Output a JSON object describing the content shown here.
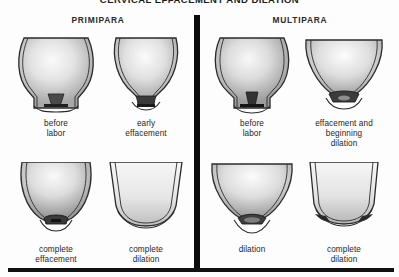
{
  "figure": {
    "title": "CERVICAL EFFACEMENT AND DILATION",
    "title_clipped": true
  },
  "columns": [
    {
      "key": "primipara",
      "label": "PRIMIPARA"
    },
    {
      "key": "multipara",
      "label": "MULTIPARA"
    }
  ],
  "divider": {
    "color": "#0a0a0a",
    "orientation": "vertical"
  },
  "bottom_rule": {
    "color": "#111111"
  },
  "colors": {
    "ink": "#1a1a1a",
    "outline": "#2b2b2b",
    "tissue_light": "#f2f2f2",
    "tissue_mid": "#cfcfcf",
    "tissue_dark": "#8f8f8f",
    "os_dark": "#262626",
    "page": "#ffffff"
  },
  "panels": [
    {
      "id": "primipara-before-labor",
      "column": "primipara",
      "row": 1,
      "caption_lines": [
        "before",
        "labor"
      ],
      "caption": "before labor",
      "art": "uterus-cervix-closed-long"
    },
    {
      "id": "primipara-early-effacement",
      "column": "primipara",
      "row": 1,
      "caption_lines": [
        "early",
        "effacement"
      ],
      "caption": "early effacement",
      "art": "uterus-cervix-early-effacement"
    },
    {
      "id": "multipara-before-labor",
      "column": "multipara",
      "row": 1,
      "caption_lines": [
        "before",
        "labor"
      ],
      "caption": "before labor",
      "art": "uterus-cervix-closed-long"
    },
    {
      "id": "multipara-effacement-beginning-dilation",
      "column": "multipara",
      "row": 1,
      "caption_lines": [
        "effacement and",
        "beginning",
        "dilation"
      ],
      "caption": "effacement and beginning dilation",
      "art": "uterus-cervix-effaced-beginning-dilation"
    },
    {
      "id": "primipara-complete-effacement",
      "column": "primipara",
      "row": 2,
      "caption_lines": [
        "complete",
        "effacement"
      ],
      "caption": "complete effacement",
      "art": "uterus-cervix-complete-effacement"
    },
    {
      "id": "primipara-complete-dilation",
      "column": "primipara",
      "row": 2,
      "caption_lines": [
        "complete",
        "dilation"
      ],
      "caption": "complete dilation",
      "art": "uterus-cervix-complete-dilation"
    },
    {
      "id": "multipara-dilation",
      "column": "multipara",
      "row": 2,
      "caption_lines": [
        "dilation"
      ],
      "caption": "dilation",
      "art": "uterus-cervix-dilation"
    },
    {
      "id": "multipara-complete-dilation",
      "column": "multipara",
      "row": 2,
      "caption_lines": [
        "complete",
        "dilation"
      ],
      "caption": "complete dilation",
      "art": "uterus-cervix-complete-dilation"
    }
  ]
}
